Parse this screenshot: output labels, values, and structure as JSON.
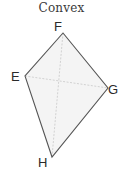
{
  "title": "Convex",
  "colors": {
    "edge": "#555555",
    "diagonal": "#c8c8c8",
    "fill": "#f4f4f4",
    "label": "#2a2a2a"
  },
  "vertices": [
    {
      "label": "F",
      "x": 63,
      "y": 33
    },
    {
      "label": "G",
      "x": 108,
      "y": 88
    },
    {
      "label": "H",
      "x": 52,
      "y": 157
    },
    {
      "label": "E",
      "x": 25,
      "y": 76
    }
  ],
  "diagonals": [
    {
      "from": "F",
      "to": "H"
    },
    {
      "from": "E",
      "to": "G"
    }
  ],
  "labels": {
    "F": "F",
    "E": "E",
    "G": "G",
    "H": "H"
  }
}
